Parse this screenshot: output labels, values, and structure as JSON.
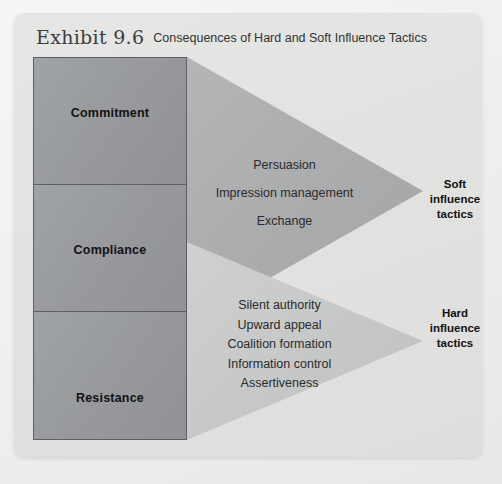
{
  "exhibit": {
    "number_label": "Exhibit 9.6",
    "caption": "Consequences of Hard and Soft Influence Tactics"
  },
  "outcomes": [
    {
      "id": "commitment",
      "label": "Commitment"
    },
    {
      "id": "compliance",
      "label": "Compliance"
    },
    {
      "id": "resistance",
      "label": "Resistance"
    }
  ],
  "soft": {
    "category_line1": "Soft",
    "category_line2": "influence",
    "category_line3": "tactics",
    "tactics": [
      "Persuasion",
      "Impression management",
      "Exchange"
    ]
  },
  "hard": {
    "category_line1": "Hard",
    "category_line2": "influence",
    "category_line3": "tactics",
    "tactics": [
      "Silent authority",
      "Upward appeal",
      "Coalition formation",
      "Information control",
      "Assertiveness"
    ]
  },
  "colors": {
    "page_background": "#f2f2f0",
    "card_background": "#e3e3e1",
    "outcome_box_fill": "#989a9d",
    "outcome_box_border": "#5c5e61",
    "soft_arrow_fill": "#a9abad",
    "hard_arrow_fill": "#c6c7c7",
    "text_dark": "#121212"
  }
}
